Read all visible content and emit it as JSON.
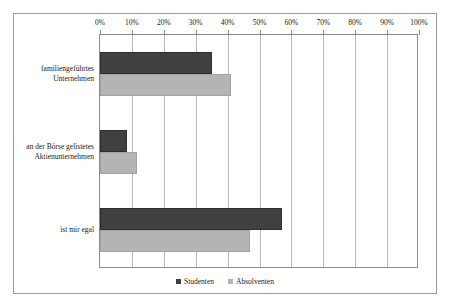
{
  "chart_data": {
    "type": "bar",
    "orientation": "horizontal",
    "title": "",
    "subtitle": "",
    "xlabel": "",
    "ylabel": "",
    "xlim": [
      0,
      100
    ],
    "grid": true,
    "legend_position": "bottom",
    "xticks": [
      "0%",
      "10%",
      "20%",
      "30%",
      "40%",
      "50%",
      "60%",
      "70%",
      "80%",
      "90%",
      "100%"
    ],
    "xtick_values": [
      0,
      10,
      20,
      30,
      40,
      50,
      60,
      70,
      80,
      90,
      100
    ],
    "categories": [
      "familiengeführtes Unternehmen",
      "an der Börse gelistetes Aktienunternehmen",
      "ist mir egal"
    ],
    "category_lines": [
      [
        "familiengeführtes",
        "Unternehmen"
      ],
      [
        "an der Börse gelistetes",
        "Aktienunternehmen"
      ],
      [
        "ist mir egal"
      ]
    ],
    "series": [
      {
        "name": "Studenten",
        "color": "#404040",
        "values": [
          35,
          8.5,
          57
        ]
      },
      {
        "name": "Absolventen",
        "color": "#b4b4b4",
        "values": [
          41,
          11.5,
          47
        ]
      }
    ]
  },
  "legend": {
    "items": [
      {
        "label": "Studenten",
        "color": "#404040"
      },
      {
        "label": "Absolventen",
        "color": "#b4b4b4"
      }
    ]
  }
}
